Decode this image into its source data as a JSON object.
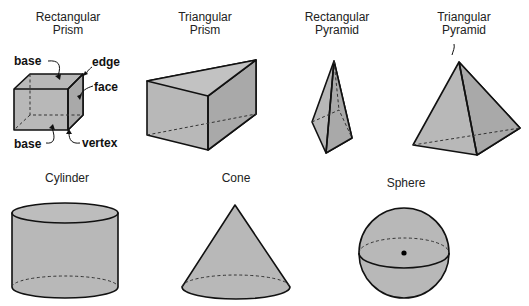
{
  "figure": {
    "shapes": [
      {
        "id": "rectangular-prism",
        "name_line1": "Rectangular",
        "name_line2": "Prism",
        "labels": {
          "base_top": "base",
          "edge": "edge",
          "face": "face",
          "base_bottom": "base",
          "vertex": "vertex"
        }
      },
      {
        "id": "triangular-prism",
        "name_line1": "Triangular",
        "name_line2": "Prism"
      },
      {
        "id": "rectangular-pyramid",
        "name_line1": "Rectangular",
        "name_line2": "Pyramid"
      },
      {
        "id": "triangular-pyramid",
        "name_line1": "Triangular",
        "name_line2": "Pyramid"
      },
      {
        "id": "cylinder",
        "name_line1": "Cylinder"
      },
      {
        "id": "cone",
        "name_line1": "Cone"
      },
      {
        "id": "sphere",
        "name_line1": "Sphere"
      }
    ],
    "colors": {
      "fill": "#b8b8b8",
      "stroke": "#111111"
    }
  }
}
